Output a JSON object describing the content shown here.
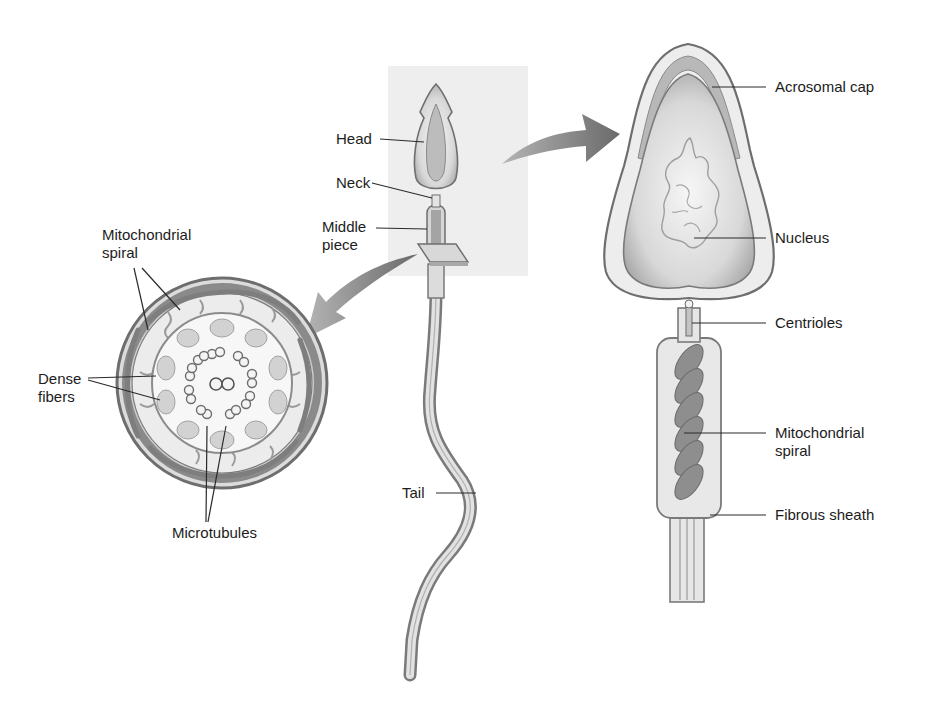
{
  "diagram": {
    "colors": {
      "background": "#ffffff",
      "highlight_box": "#efefef",
      "outline": "#707070",
      "fill_light": "#e4e4e4",
      "fill_mid": "#c8c8c8",
      "mito": "#8c8c8c",
      "arrow": "#7a7a7a",
      "text": "#1c1c1c"
    },
    "whole_cell_labels": {
      "head": "Head",
      "neck": "Neck",
      "middle_piece": "Middle\npiece",
      "tail": "Tail"
    },
    "cross_section_labels": {
      "mitochondrial_spiral": "Mitochondrial\nspiral",
      "dense_fibers": "Dense\nfibers",
      "microtubules": "Microtubules"
    },
    "enlarged_head_labels": {
      "acrosomal_cap": "Acrosomal cap",
      "nucleus": "Nucleus",
      "centrioles": "Centrioles",
      "mitochondrial_spiral": "Mitochondrial\nspiral",
      "fibrous_sheath": "Fibrous sheath"
    }
  }
}
